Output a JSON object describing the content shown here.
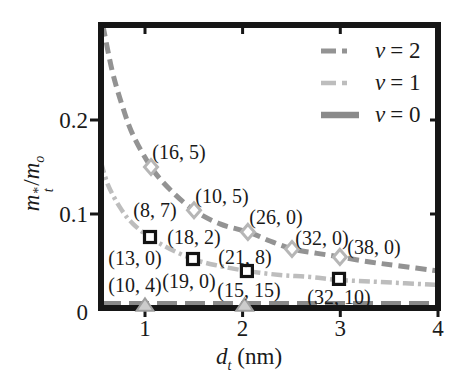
{
  "figure": {
    "background": "#ffffff",
    "text_color": "#1a1a1a",
    "frame_color": "#161616"
  },
  "chart_data": {
    "type": "line",
    "title": "",
    "xlabel": "d_t (nm)",
    "ylabel": "m_t*/m_o",
    "xlabel_rich": {
      "base": "d",
      "sub": "t",
      "unit": "(nm)"
    },
    "ylabel_rich": {
      "num": "m",
      "num_sup": "*",
      "num_sub": "t",
      "sep": "/",
      "den": "m",
      "den_sub": "o"
    },
    "xlim": [
      0.55,
      4.0
    ],
    "ylim": [
      0,
      0.301
    ],
    "grid": false,
    "legend_position": "upper right",
    "xticks": [
      {
        "v": 1,
        "label": "1"
      },
      {
        "v": 2,
        "label": "2"
      },
      {
        "v": 3,
        "label": "3"
      },
      {
        "v": 4,
        "label": "4"
      }
    ],
    "yticks": [
      {
        "v": 0,
        "label": "0"
      },
      {
        "v": 0.1,
        "label": "0.1"
      },
      {
        "v": 0.2,
        "label": "0.2"
      }
    ],
    "series": [
      {
        "name": "ν = 2",
        "symbol": "ν",
        "eq": "= 2",
        "line_color": "#939393",
        "line_width": 5,
        "dash": [
          11,
          6
        ],
        "legend_dash": "15 6 5 99",
        "marker": "open-diamond",
        "marker_color": "#b6b6b6",
        "curve": [
          [
            0.57,
            0.3
          ],
          [
            0.663,
            0.253
          ],
          [
            0.765,
            0.216
          ],
          [
            0.878,
            0.184
          ],
          [
            1.062,
            0.15
          ],
          [
            1.256,
            0.126
          ],
          [
            1.502,
            0.104
          ],
          [
            1.768,
            0.0894
          ],
          [
            2.054,
            0.0809
          ],
          [
            2.28,
            0.0713
          ],
          [
            2.505,
            0.0628
          ],
          [
            2.74,
            0.0585
          ],
          [
            2.996,
            0.0543
          ],
          [
            3.303,
            0.0489
          ],
          [
            3.61,
            0.0447
          ],
          [
            4.0,
            0.0394
          ]
        ],
        "data_points": [
          {
            "d": 1.062,
            "m": 0.15
          },
          {
            "d": 1.502,
            "m": 0.104
          },
          {
            "d": 2.054,
            "m": 0.0809
          },
          {
            "d": 2.505,
            "m": 0.0628
          },
          {
            "d": 2.996,
            "m": 0.0543
          }
        ]
      },
      {
        "name": "ν = 1",
        "symbol": "ν",
        "eq": "= 1",
        "line_color": "#bdbdbd",
        "line_width": 4.5,
        "dash": [
          11,
          4,
          3,
          4
        ],
        "legend_dash": "15 6 5 99",
        "marker": "open-square",
        "marker_color": "#131313",
        "curve": [
          [
            0.55,
            0.155
          ],
          [
            0.622,
            0.131
          ],
          [
            0.744,
            0.107
          ],
          [
            0.878,
            0.0894
          ],
          [
            1.062,
            0.0745
          ],
          [
            1.256,
            0.0628
          ],
          [
            1.492,
            0.0521
          ],
          [
            1.717,
            0.0457
          ],
          [
            2.044,
            0.0394
          ],
          [
            2.382,
            0.0351
          ],
          [
            2.689,
            0.033
          ],
          [
            2.986,
            0.0298
          ],
          [
            3.406,
            0.0277
          ],
          [
            4.0,
            0.0245
          ]
        ],
        "data_points": [
          {
            "d": 1.052,
            "m": 0.0755
          },
          {
            "d": 1.492,
            "m": 0.0521
          },
          {
            "d": 2.044,
            "m": 0.0394
          },
          {
            "d": 2.986,
            "m": 0.0309
          }
        ]
      },
      {
        "name": "ν = 0",
        "symbol": "ν",
        "eq": "= 0",
        "line_color": "#8a8a8a",
        "line_width": 5.5,
        "dash": [
          20,
          8
        ],
        "legend_dash": "",
        "marker": "triangle-up",
        "marker_color": "#cccccc",
        "curve": [
          [
            0.55,
            0.003
          ],
          [
            4.0,
            0.003
          ]
        ],
        "data_points": [
          {
            "d": 1.0,
            "m": 0.003
          },
          {
            "d": 2.02,
            "m": 0.003
          }
        ]
      }
    ],
    "annotations": [
      {
        "text": "(16, 5)",
        "d": 1.348,
        "m": 0.166
      },
      {
        "text": "(10, 5)",
        "d": 1.788,
        "m": 0.119
      },
      {
        "text": "(8, 7)",
        "d": 1.103,
        "m": 0.104
      },
      {
        "text": "(26, 0)",
        "d": 2.341,
        "m": 0.0968
      },
      {
        "text": "(18, 2)",
        "d": 1.502,
        "m": 0.0755
      },
      {
        "text": "(32, 0)",
        "d": 2.812,
        "m": 0.0745
      },
      {
        "text": "(38, 0)",
        "d": 3.344,
        "m": 0.0649
      },
      {
        "text": "(13, 0)",
        "d": 0.898,
        "m": 0.0532
      },
      {
        "text": "(21, 8)",
        "d": 2.024,
        "m": 0.0543
      },
      {
        "text": "(19, 0)",
        "d": 1.451,
        "m": 0.0287
      },
      {
        "text": "(10, 4)",
        "d": 0.898,
        "m": 0.0245
      },
      {
        "text": "(15, 15)",
        "d": 2.065,
        "m": 0.0191
      },
      {
        "text": "(32, 10)",
        "d": 2.986,
        "m": 0.0117
      }
    ]
  }
}
